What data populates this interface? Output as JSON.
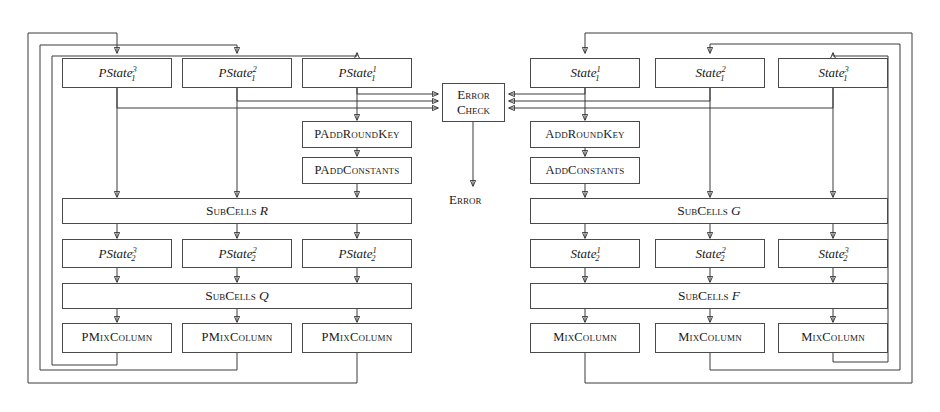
{
  "figure": {
    "background_color": "#ffffff",
    "line_color": "#3a3a3a",
    "box_border_color": "#4a4a4a",
    "text_color": "#1a1a1a"
  },
  "error_check": {
    "line1": "Error",
    "line2": "Check",
    "output_label": "Error"
  },
  "left_pipeline": {
    "states_row1": [
      {
        "base": "PState",
        "sup": "3",
        "sub": "1"
      },
      {
        "base": "PState",
        "sup": "2",
        "sub": "1"
      },
      {
        "base": "PState",
        "sup": "1",
        "sub": "1"
      }
    ],
    "ops": [
      {
        "label": "PAddRoundKey"
      },
      {
        "label": "PAddConstants"
      }
    ],
    "subcells_upper": {
      "name": "SubCells",
      "operand": "R"
    },
    "states_row2": [
      {
        "base": "PState",
        "sup": "3",
        "sub": "2"
      },
      {
        "base": "PState",
        "sup": "2",
        "sub": "2"
      },
      {
        "base": "PState",
        "sup": "1",
        "sub": "2"
      }
    ],
    "subcells_lower": {
      "name": "SubCells",
      "operand": "Q"
    },
    "mixcolumns": [
      {
        "label": "PMixColumn"
      },
      {
        "label": "PMixColumn"
      },
      {
        "label": "PMixColumn"
      }
    ]
  },
  "right_pipeline": {
    "states_row1": [
      {
        "base": "State",
        "sup": "1",
        "sub": "1"
      },
      {
        "base": "State",
        "sup": "2",
        "sub": "1"
      },
      {
        "base": "State",
        "sup": "3",
        "sub": "1"
      }
    ],
    "ops": [
      {
        "label": "AddRoundKey"
      },
      {
        "label": "AddConstants"
      }
    ],
    "subcells_upper": {
      "name": "SubCells",
      "operand": "G"
    },
    "states_row2": [
      {
        "base": "State",
        "sup": "1",
        "sub": "2"
      },
      {
        "base": "State",
        "sup": "2",
        "sub": "2"
      },
      {
        "base": "State",
        "sup": "3",
        "sub": "2"
      }
    ],
    "subcells_lower": {
      "name": "SubCells",
      "operand": "F"
    },
    "mixcolumns": [
      {
        "label": "MixColumn"
      },
      {
        "label": "MixColumn"
      },
      {
        "label": "MixColumn"
      }
    ]
  }
}
